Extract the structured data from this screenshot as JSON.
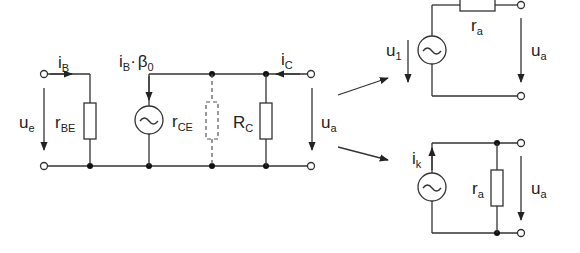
{
  "diagram": {
    "main_circuit": {
      "input_current": {
        "base": "i",
        "sub": "B"
      },
      "input_voltage": {
        "base": "u",
        "sub": "e"
      },
      "r_be": {
        "base": "r",
        "sub": "BE"
      },
      "current_source": {
        "base": "i",
        "sub": "B",
        "mid": "·",
        "beta": "β",
        "beta_sub": "0"
      },
      "r_ce": {
        "base": "r",
        "sub": "CE"
      },
      "r_c": {
        "base": "R",
        "sub": "C"
      },
      "collector_current": {
        "base": "i",
        "sub": "C"
      },
      "output_voltage": {
        "base": "u",
        "sub": "a"
      }
    },
    "voltage_source_equivalent": {
      "source_voltage": {
        "base": "u",
        "sub": "1"
      },
      "resistor": {
        "base": "r",
        "sub": "a"
      },
      "output_voltage": {
        "base": "u",
        "sub": "a"
      }
    },
    "current_source_equivalent": {
      "source_current": {
        "base": "i",
        "sub": "k"
      },
      "resistor": {
        "base": "r",
        "sub": "a"
      },
      "output_voltage": {
        "base": "u",
        "sub": "a"
      }
    },
    "colors": {
      "line": "#333333",
      "background": "#ffffff"
    }
  }
}
